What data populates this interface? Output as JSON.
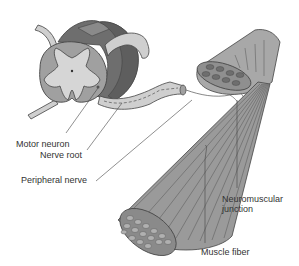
{
  "diagram": {
    "type": "anatomical illustration",
    "colors": {
      "background": "#ffffff",
      "white_matter_dark": "#6e6e6e",
      "white_matter_mid": "#a0a0a0",
      "gray_matter": "#d6d6d6",
      "nerve": "#cfcfcf",
      "muscle": "#9a9a9a",
      "outline": "#444444",
      "label_text": "#333333"
    }
  },
  "labels": {
    "motor_neuron": "Motor neuron",
    "nerve_root": "Nerve root",
    "peripheral_nerve": "Peripheral nerve",
    "neuromuscular_junction_line1": "Neuromuscular",
    "neuromuscular_junction_line2": "junction",
    "muscle_fiber": "Muscle fiber"
  }
}
